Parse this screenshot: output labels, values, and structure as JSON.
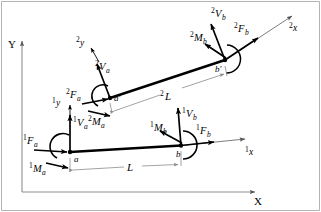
{
  "figure": {
    "type": "free-body-diagram",
    "width": 321,
    "height": 212,
    "background": "#ffffff",
    "frame_color": "#9a9a9a",
    "beam_color": "#000000",
    "dimension_color": "#8c8c8c"
  },
  "global_axes": {
    "x_label": "X",
    "y_label": "Y",
    "origin": [
      22,
      192
    ],
    "x_end": [
      258,
      192
    ],
    "y_end": [
      22,
      38
    ]
  },
  "configurations": [
    {
      "id": "config-1",
      "superscript": "1",
      "name": "undeformed-beam",
      "local_axes": {
        "x_label": "x",
        "y_label": "y",
        "superscript": "1"
      },
      "nodes": [
        {
          "id": "a",
          "label": "a",
          "x": 70,
          "y": 152
        },
        {
          "id": "b",
          "label": "b",
          "x": 181,
          "y": 145
        }
      ],
      "length_label": "L",
      "loads": [
        {
          "name": "force-a",
          "label": "F",
          "sub": "a",
          "sup": "1"
        },
        {
          "name": "moment-a",
          "label": "M",
          "sub": "a",
          "sup": "1"
        },
        {
          "name": "shear-a",
          "label": "V",
          "sub": "a",
          "sup": "1"
        },
        {
          "name": "force-b",
          "label": "F",
          "sub": "b",
          "sup": "1"
        },
        {
          "name": "moment-b",
          "label": "M",
          "sub": "b",
          "sup": "1"
        },
        {
          "name": "shear-b",
          "label": "V",
          "sub": "b",
          "sup": "1"
        }
      ]
    },
    {
      "id": "config-2",
      "superscript": "2",
      "name": "deformed-beam",
      "local_axes": {
        "x_label": "x",
        "y_label": "y",
        "superscript": "2"
      },
      "nodes": [
        {
          "id": "a-prime",
          "label": "a'",
          "x": 110,
          "y": 98
        },
        {
          "id": "b-prime",
          "label": "b'",
          "x": 225,
          "y": 60
        }
      ],
      "length_label": "L",
      "loads": [
        {
          "name": "force-a",
          "label": "F",
          "sub": "a",
          "sup": "2"
        },
        {
          "name": "moment-a",
          "label": "M",
          "sub": "a",
          "sup": "2"
        },
        {
          "name": "shear-a",
          "label": "V",
          "sub": "a",
          "sup": "2"
        },
        {
          "name": "force-b",
          "label": "F",
          "sub": "b",
          "sup": "2"
        },
        {
          "name": "moment-b",
          "label": "M",
          "sub": "b",
          "sup": "2"
        },
        {
          "name": "shear-b",
          "label": "V",
          "sub": "b",
          "sup": "2"
        }
      ]
    }
  ],
  "labels": {
    "global_x": "X",
    "global_y": "Y",
    "node_a": "a",
    "node_b": "b",
    "node_a_prime": "a'",
    "node_b_prime": "b'",
    "length": "L",
    "sup1": "1",
    "sup2": "2",
    "axis_x": "x",
    "axis_y": "y",
    "F": "F",
    "M": "M",
    "V": "V",
    "sub_a": "a",
    "sub_b": "b"
  }
}
